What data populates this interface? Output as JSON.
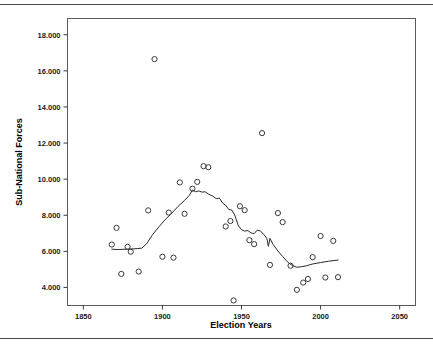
{
  "figure": {
    "has_top_rule": true,
    "has_bottom_rule": true
  },
  "chart_data": {
    "type": "scatter",
    "title": "",
    "xlabel": "Election Years",
    "ylabel": "Sub-National Forces",
    "xlim": [
      1840,
      2060
    ],
    "ylim": [
      3.0,
      18.9
    ],
    "grid": false,
    "legend": null,
    "xticks": [
      1850,
      1900,
      1950,
      2000,
      2050
    ],
    "xtick_labels": [
      "1850",
      "1900",
      "1950",
      "2000",
      "2050"
    ],
    "yticks": [
      4,
      6,
      8,
      10,
      12,
      14,
      16,
      18
    ],
    "ytick_labels": [
      "4.000",
      "6.000",
      "8.000",
      "10.000",
      "12.000",
      "14.000",
      "16.000",
      "18.000"
    ],
    "marker": "open-circle",
    "marker_color": "#3a3a3a",
    "line_color": "#2a2a2a",
    "points": [
      {
        "x": 1868,
        "y": 6.38
      },
      {
        "x": 1871,
        "y": 7.3
      },
      {
        "x": 1874,
        "y": 4.75
      },
      {
        "x": 1878,
        "y": 6.25
      },
      {
        "x": 1880,
        "y": 5.98
      },
      {
        "x": 1885,
        "y": 4.88
      },
      {
        "x": 1891,
        "y": 8.27
      },
      {
        "x": 1895,
        "y": 16.65
      },
      {
        "x": 1900,
        "y": 5.7
      },
      {
        "x": 1904,
        "y": 8.15
      },
      {
        "x": 1907,
        "y": 5.65
      },
      {
        "x": 1911,
        "y": 9.82
      },
      {
        "x": 1914,
        "y": 8.08
      },
      {
        "x": 1919,
        "y": 9.47
      },
      {
        "x": 1922,
        "y": 9.85
      },
      {
        "x": 1926,
        "y": 10.72
      },
      {
        "x": 1929,
        "y": 10.66
      },
      {
        "x": 1940,
        "y": 7.38
      },
      {
        "x": 1943,
        "y": 7.68
      },
      {
        "x": 1945,
        "y": 3.28
      },
      {
        "x": 1949,
        "y": 8.5
      },
      {
        "x": 1952,
        "y": 8.28
      },
      {
        "x": 1955,
        "y": 6.62
      },
      {
        "x": 1958,
        "y": 6.4
      },
      {
        "x": 1963,
        "y": 12.55
      },
      {
        "x": 1968,
        "y": 5.25
      },
      {
        "x": 1973,
        "y": 8.12
      },
      {
        "x": 1976,
        "y": 7.62
      },
      {
        "x": 1981,
        "y": 5.2
      },
      {
        "x": 1985,
        "y": 3.87
      },
      {
        "x": 1989,
        "y": 4.27
      },
      {
        "x": 1992,
        "y": 4.47
      },
      {
        "x": 1995,
        "y": 5.68
      },
      {
        "x": 2000,
        "y": 6.85
      },
      {
        "x": 2003,
        "y": 4.55
      },
      {
        "x": 2008,
        "y": 6.58
      },
      {
        "x": 2011,
        "y": 4.57
      }
    ],
    "trend_line": {
      "name": "smoothed-fit",
      "points": [
        {
          "x": 1868,
          "y": 6.12
        },
        {
          "x": 1872,
          "y": 6.1
        },
        {
          "x": 1877,
          "y": 6.12
        },
        {
          "x": 1880,
          "y": 6.13
        },
        {
          "x": 1884,
          "y": 6.15
        },
        {
          "x": 1887,
          "y": 6.18
        },
        {
          "x": 1890,
          "y": 6.42
        },
        {
          "x": 1894,
          "y": 6.95
        },
        {
          "x": 1898,
          "y": 7.38
        },
        {
          "x": 1902,
          "y": 7.78
        },
        {
          "x": 1906,
          "y": 8.12
        },
        {
          "x": 1910,
          "y": 8.5
        },
        {
          "x": 1914,
          "y": 8.82
        },
        {
          "x": 1917,
          "y": 9.1
        },
        {
          "x": 1919,
          "y": 9.4
        },
        {
          "x": 1921,
          "y": 9.3
        },
        {
          "x": 1923,
          "y": 9.35
        },
        {
          "x": 1925,
          "y": 9.28
        },
        {
          "x": 1927,
          "y": 9.3
        },
        {
          "x": 1929,
          "y": 9.18
        },
        {
          "x": 1932,
          "y": 9.05
        },
        {
          "x": 1934,
          "y": 8.92
        },
        {
          "x": 1936,
          "y": 8.95
        },
        {
          "x": 1938,
          "y": 8.68
        },
        {
          "x": 1940,
          "y": 8.55
        },
        {
          "x": 1942,
          "y": 8.32
        },
        {
          "x": 1944,
          "y": 8.28
        },
        {
          "x": 1946,
          "y": 7.95
        },
        {
          "x": 1948,
          "y": 7.42
        },
        {
          "x": 1950,
          "y": 7.2
        },
        {
          "x": 1952,
          "y": 7.12
        },
        {
          "x": 1954,
          "y": 7.15
        },
        {
          "x": 1956,
          "y": 7.02
        },
        {
          "x": 1958,
          "y": 6.98
        },
        {
          "x": 1960,
          "y": 7.18
        },
        {
          "x": 1962,
          "y": 7.12
        },
        {
          "x": 1964,
          "y": 6.95
        },
        {
          "x": 1966,
          "y": 6.72
        },
        {
          "x": 1967,
          "y": 6.28
        },
        {
          "x": 1968,
          "y": 6.72
        },
        {
          "x": 1970,
          "y": 6.38
        },
        {
          "x": 1973,
          "y": 6.02
        },
        {
          "x": 1976,
          "y": 5.72
        },
        {
          "x": 1979,
          "y": 5.42
        },
        {
          "x": 1982,
          "y": 5.22
        },
        {
          "x": 1985,
          "y": 5.12
        },
        {
          "x": 1988,
          "y": 5.15
        },
        {
          "x": 1991,
          "y": 5.2
        },
        {
          "x": 1995,
          "y": 5.3
        },
        {
          "x": 2000,
          "y": 5.38
        },
        {
          "x": 2005,
          "y": 5.45
        },
        {
          "x": 2011,
          "y": 5.52
        }
      ]
    }
  }
}
